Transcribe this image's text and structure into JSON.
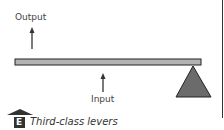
{
  "diagram": {
    "output_label": "Output",
    "input_label": "Input",
    "caption": "Third-class levers",
    "badge_letter": "E"
  },
  "colors": {
    "lever": "#b3b3b3",
    "lever_border": "#222222",
    "fulcrum": "#6b6b6b",
    "arrow": "#333333"
  }
}
